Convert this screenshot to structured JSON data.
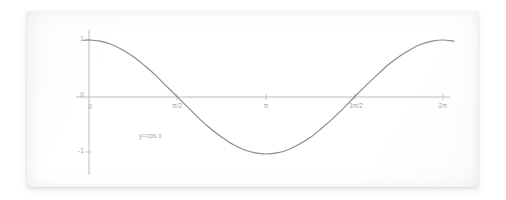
{
  "figure": {
    "kind": "scanned-graph-card",
    "background_color": "#ffffff",
    "card_color": "#ffffff",
    "axis_color": "#b0b0b0",
    "curve_color": "#8a8a8a",
    "label_color": "#a3a3a3"
  },
  "chart_data": {
    "type": "line",
    "title": "",
    "subtitle": "",
    "xlabel": "",
    "ylabel": "",
    "annotation": "y=cos x",
    "function": "y = cos x",
    "grid": false,
    "legend": null,
    "xlim": [
      -0.1,
      6.55
    ],
    "ylim": [
      -1.28,
      1.28
    ],
    "x_tick_labels": [
      "0",
      "π/2",
      "π",
      "3π/2",
      "2π"
    ],
    "x_tick_values": [
      0,
      1.5708,
      3.1416,
      4.7124,
      6.2832
    ],
    "y_tick_labels": [
      "1",
      "0",
      "-1"
    ],
    "y_tick_values": [
      1,
      0,
      -1
    ],
    "series": [
      {
        "name": "y=cos x",
        "x": [
          -0.1,
          0.0,
          0.2,
          0.39,
          0.59,
          0.79,
          0.98,
          1.18,
          1.37,
          1.57,
          1.77,
          1.96,
          2.16,
          2.36,
          2.55,
          2.75,
          2.95,
          3.14,
          3.34,
          3.53,
          3.73,
          3.93,
          4.12,
          4.32,
          4.52,
          4.71,
          4.91,
          5.11,
          5.3,
          5.5,
          5.7,
          5.89,
          6.09,
          6.28,
          6.48
        ],
        "y": [
          0.995,
          1.0,
          0.98,
          0.924,
          0.831,
          0.707,
          0.556,
          0.383,
          0.195,
          0.0,
          -0.195,
          -0.383,
          -0.556,
          -0.707,
          -0.831,
          -0.924,
          -0.98,
          -1.0,
          -0.98,
          -0.924,
          -0.831,
          -0.707,
          -0.556,
          -0.383,
          -0.195,
          0.0,
          0.195,
          0.383,
          0.556,
          0.707,
          0.831,
          0.924,
          0.98,
          1.0,
          0.98
        ]
      }
    ]
  },
  "labels": {
    "y_one": "1",
    "y_zero": "0",
    "y_neg_one": "-1",
    "x_zero": "0",
    "x_half_pi": "π/2",
    "x_pi": "π",
    "x_three_half_pi": "3π/2",
    "x_two_pi": "2π",
    "equation": "y=cos x"
  }
}
